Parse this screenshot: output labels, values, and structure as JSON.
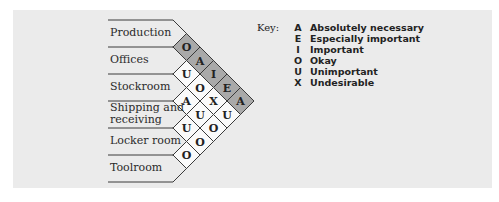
{
  "departments": [
    "Production",
    "Offices",
    "Stockroom",
    "Shipping and receiving",
    "Locker room",
    "Toolroom"
  ],
  "department_lines": [
    [
      "Production"
    ],
    [
      "Offices"
    ],
    [
      "Stockroom"
    ],
    [
      "Shipping and",
      "receiving"
    ],
    [
      "Locker room"
    ],
    [
      "Toolroom"
    ]
  ],
  "relationships": [
    {
      "a": 0,
      "b": 1,
      "code": "O"
    },
    {
      "a": 0,
      "b": 2,
      "code": "A"
    },
    {
      "a": 0,
      "b": 3,
      "code": "I"
    },
    {
      "a": 0,
      "b": 4,
      "code": "E"
    },
    {
      "a": 0,
      "b": 5,
      "code": "A"
    },
    {
      "a": 1,
      "b": 2,
      "code": "U"
    },
    {
      "a": 1,
      "b": 3,
      "code": "O"
    },
    {
      "a": 1,
      "b": 4,
      "code": "X"
    },
    {
      "a": 1,
      "b": 5,
      "code": "U"
    },
    {
      "a": 2,
      "b": 3,
      "code": "A"
    },
    {
      "a": 2,
      "b": 4,
      "code": "U"
    },
    {
      "a": 2,
      "b": 5,
      "code": "O"
    },
    {
      "a": 3,
      "b": 4,
      "code": "U"
    },
    {
      "a": 3,
      "b": 5,
      "code": "O"
    },
    {
      "a": 4,
      "b": 5,
      "code": "O"
    }
  ],
  "shaded_department": 0,
  "colors": {
    "shaded": "#a9a9a9",
    "unshaded": "#fafafa",
    "line": "#3a3a3a",
    "panel": "#ebebeb"
  },
  "key": {
    "title": "Key:",
    "items": [
      {
        "code": "A",
        "label": "Absolutely necessary"
      },
      {
        "code": "E",
        "label": "Especially important"
      },
      {
        "code": "I",
        "label": "Important"
      },
      {
        "code": "O",
        "label": "Okay"
      },
      {
        "code": "U",
        "label": "Unimportant"
      },
      {
        "code": "X",
        "label": "Undesirable"
      }
    ]
  }
}
